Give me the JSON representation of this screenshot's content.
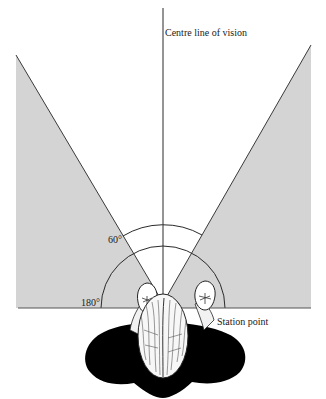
{
  "diagram": {
    "labels": {
      "centre_line": "Centre line of vision",
      "cone_angle": "60°",
      "field_angle": "180°",
      "station_point": "Station point"
    },
    "colors": {
      "background": "#ffffff",
      "outside_cone_fill": "#d4d4d4",
      "lines": "#333333",
      "figure_shadow": "#000000"
    },
    "elements": [
      "centre line of vision (vertical line)",
      "60° cone of vision (white wedge)",
      "shaded area outside cone",
      "60° arc",
      "180° semicircle",
      "ground line",
      "viewer seen from above at station point"
    ]
  }
}
